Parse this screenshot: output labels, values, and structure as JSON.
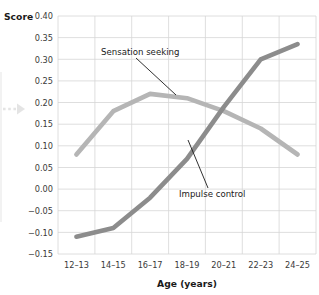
{
  "chart_data": {
    "type": "line",
    "title": "",
    "xlabel": "Age (years)",
    "ylabel": "Score",
    "categories": [
      "12–13",
      "14–15",
      "16–17",
      "18–19",
      "20–21",
      "22–23",
      "24–25"
    ],
    "ylim": [
      -0.15,
      0.4
    ],
    "ytick_labels": [
      "0.40",
      "0.35",
      "0.30",
      "0.25",
      "0.20",
      "0.15",
      "0.10",
      "0.05",
      "0.00",
      "−0.05",
      "−0.10",
      "−0.15"
    ],
    "ytick_values": [
      0.4,
      0.35,
      0.3,
      0.25,
      0.2,
      0.15,
      0.1,
      0.05,
      0.0,
      -0.05,
      -0.1,
      -0.15
    ],
    "grid": true,
    "legend_position": "inline-annotations",
    "series": [
      {
        "name": "Sensation seeking",
        "color": "#b5b5b5",
        "values": [
          0.08,
          0.18,
          0.22,
          0.21,
          0.18,
          0.14,
          0.08
        ]
      },
      {
        "name": "Impulse control",
        "color": "#8c8c8c",
        "values": [
          -0.11,
          -0.09,
          -0.02,
          0.07,
          0.19,
          0.3,
          0.335
        ]
      }
    ],
    "annotations": [
      {
        "text": "Sensation seeking",
        "target_series": "Sensation seeking"
      },
      {
        "text": "Impulse control",
        "target_series": "Impulse control"
      }
    ]
  },
  "decor": {
    "arrow_marker": "dashed-right-arrow"
  },
  "colors": {
    "grid": "#d6d6d6",
    "axis_text": "#3a3a3a",
    "title_text": "#1a1a1a",
    "sensation_seeking": "#b5b5b5",
    "impulse_control": "#8c8c8c",
    "leader_line": "#1a1a1a",
    "background": "#ffffff"
  }
}
